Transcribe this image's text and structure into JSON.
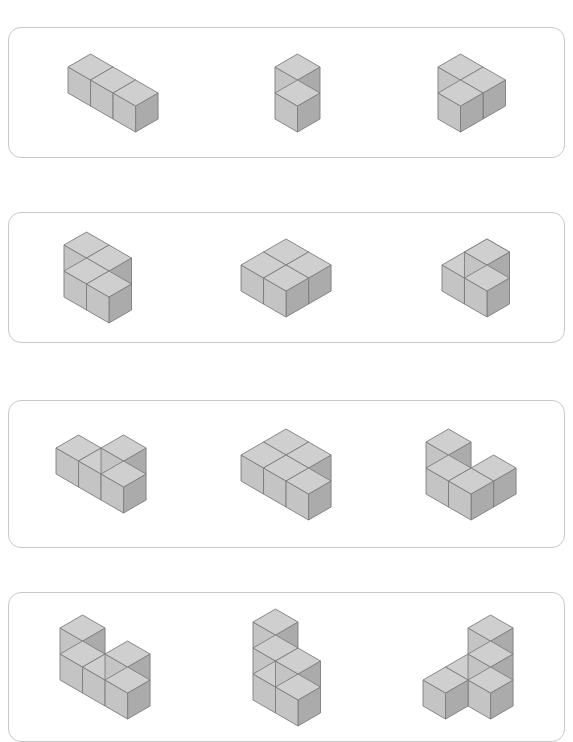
{
  "document": {
    "kind": "worksheet",
    "title": "Isometric Cube Structures Worksheet",
    "background_color": "#ffffff",
    "page_width": 573,
    "page_height": 735
  },
  "style": {
    "panel_border_color": "#c9c9c9",
    "panel_fill_color": "#ffffff",
    "panel_corner_radius": 13,
    "cube_top_color": "#cfcfcf",
    "cube_left_color": "#c4c4c4",
    "cube_right_color": "#ababab",
    "cube_edge_color": "#7d7d7d",
    "cube_size_px": 26
  },
  "panels": [
    {
      "id": "panel-1",
      "index": 1,
      "x": 8,
      "y": 27,
      "width": 557,
      "height": 131,
      "figures": [
        {
          "id": "figure-1-1",
          "name": "row-of-three-cubes",
          "cube_count": 3,
          "cubes": [
            [
              0,
              0,
              0
            ],
            [
              1,
              0,
              0
            ],
            [
              2,
              0,
              0
            ]
          ],
          "origin_x": 10,
          "origin_y": 56
        },
        {
          "id": "figure-1-2",
          "name": "vertical-stack-of-two",
          "cube_count": 2,
          "cubes": [
            [
              0,
              0,
              0
            ],
            [
              0,
              0,
              1
            ]
          ],
          "origin_x": 18,
          "origin_y": 82
        },
        {
          "id": "figure-1-3",
          "name": "flat-l-tromino",
          "cube_count": 3,
          "cubes": [
            [
              0,
              0,
              0
            ],
            [
              1,
              0,
              0
            ],
            [
              1,
              1,
              0
            ]
          ],
          "origin_x": 14,
          "origin_y": 56
        }
      ]
    },
    {
      "id": "panel-2",
      "index": 2,
      "x": 8,
      "y": 212,
      "width": 557,
      "height": 131,
      "figures": [
        {
          "id": "figure-2-1",
          "name": "flat-s-tetromino",
          "cube_count": 4,
          "cubes": [
            [
              0,
              0,
              0
            ],
            [
              1,
              0,
              0
            ],
            [
              1,
              1,
              0
            ],
            [
              2,
              1,
              0
            ]
          ],
          "origin_x": 8,
          "origin_y": 50
        },
        {
          "id": "figure-2-2",
          "name": "flat-t-tetromino",
          "cube_count": 4,
          "cubes": [
            [
              0,
              0,
              0
            ],
            [
              0,
              1,
              0
            ],
            [
              1,
              1,
              0
            ],
            [
              1,
              0,
              0
            ]
          ],
          "origin_x": 20,
          "origin_y": 52
        },
        {
          "id": "figure-2-3",
          "name": "stepped-corner-four",
          "cube_count": 4,
          "cubes": [
            [
              0,
              0,
              0
            ],
            [
              0,
              1,
              0
            ],
            [
              1,
              1,
              0
            ],
            [
              1,
              1,
              1
            ]
          ],
          "origin_x": 20,
          "origin_y": 78
        }
      ]
    },
    {
      "id": "panel-3",
      "index": 3,
      "x": 8,
      "y": 400,
      "width": 557,
      "height": 148,
      "figures": [
        {
          "id": "figure-3-1",
          "name": "row-of-three-with-tower",
          "cube_count": 4,
          "cubes": [
            [
              0,
              0,
              0
            ],
            [
              1,
              0,
              0
            ],
            [
              2,
              0,
              0
            ],
            [
              2,
              0,
              1
            ]
          ],
          "origin_x": 10,
          "origin_y": 86
        },
        {
          "id": "figure-3-2",
          "name": "flat-p-pentomino",
          "cube_count": 5,
          "cubes": [
            [
              0,
              0,
              0
            ],
            [
              1,
              0,
              0
            ],
            [
              0,
              1,
              0
            ],
            [
              1,
              1,
              0
            ],
            [
              2,
              1,
              0
            ]
          ],
          "origin_x": 10,
          "origin_y": 62
        },
        {
          "id": "figure-3-3",
          "name": "diagonal-step-four",
          "cube_count": 4,
          "cubes": [
            [
              0,
              1,
              0
            ],
            [
              1,
              1,
              0
            ],
            [
              1,
              0,
              0
            ],
            [
              0,
              1,
              1
            ]
          ],
          "origin_x": 22,
          "origin_y": 88
        }
      ]
    },
    {
      "id": "panel-4",
      "index": 4,
      "x": 8,
      "y": 592,
      "width": 557,
      "height": 150,
      "figures": [
        {
          "id": "figure-4-1",
          "name": "u-shape-five",
          "cube_count": 5,
          "cubes": [
            [
              0,
              0,
              0
            ],
            [
              1,
              0,
              0
            ],
            [
              2,
              0,
              0
            ],
            [
              0,
              0,
              1
            ],
            [
              2,
              0,
              1
            ]
          ],
          "origin_x": 12,
          "origin_y": 108
        },
        {
          "id": "figure-4-2",
          "name": "stair-step-five",
          "cube_count": 5,
          "cubes": [
            [
              0,
              0,
              0
            ],
            [
              1,
              0,
              0
            ],
            [
              0,
              0,
              1
            ],
            [
              1,
              0,
              1
            ],
            [
              0,
              0,
              2
            ]
          ],
          "origin_x": 22,
          "origin_y": 116
        },
        {
          "id": "figure-4-3",
          "name": "tower-with-foot",
          "cube_count": 5,
          "cubes": [
            [
              0,
              0,
              0
            ],
            [
              1,
              0,
              0
            ],
            [
              0,
              1,
              0
            ],
            [
              1,
              0,
              1
            ],
            [
              1,
              0,
              2
            ]
          ],
          "origin_x": 20,
          "origin_y": 112
        }
      ]
    }
  ]
}
